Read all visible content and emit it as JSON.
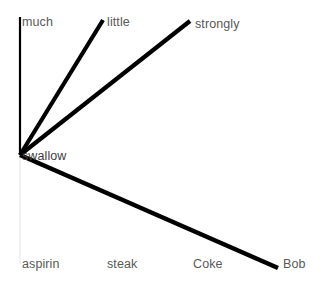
{
  "canvas": {
    "width": 325,
    "height": 292,
    "background": "#ffffff"
  },
  "colors": {
    "edge": "#000000",
    "edge_faint": "#ededed",
    "label_text": "#595959",
    "node_text": "#3d3d3d"
  },
  "center_node": {
    "label": "swallow",
    "x": 20,
    "y": 155,
    "label_x": 22,
    "label_y": 150
  },
  "edges": [
    {
      "id": "edge-much",
      "label": "much",
      "x1": 20,
      "y1": 155,
      "x2": 20,
      "y2": 17,
      "width": 2.2
    },
    {
      "id": "edge-little",
      "label": "little",
      "x1": 20,
      "y1": 155,
      "x2": 103,
      "y2": 20,
      "width": 4.2
    },
    {
      "id": "edge-strongly",
      "label": "strongly",
      "x1": 20,
      "y1": 155,
      "x2": 190,
      "y2": 21,
      "width": 4.2
    },
    {
      "id": "edge-bob",
      "label": "Bob",
      "x1": 20,
      "y1": 155,
      "x2": 278,
      "y2": 268,
      "width": 4.6
    },
    {
      "id": "edge-aspirin",
      "label": "aspirin",
      "x1": 20,
      "y1": 158,
      "x2": 20,
      "y2": 264,
      "width": 1.6
    }
  ],
  "labels": [
    {
      "id": "label-much",
      "text": "much",
      "x": 22,
      "y": 16
    },
    {
      "id": "label-little",
      "text": "little",
      "x": 107,
      "y": 16
    },
    {
      "id": "label-strongly",
      "text": "strongly",
      "x": 195,
      "y": 18
    },
    {
      "id": "label-swallow",
      "text": "swallow",
      "x": 22,
      "y": 150
    },
    {
      "id": "label-aspirin",
      "text": "aspirin",
      "x": 22,
      "y": 258
    },
    {
      "id": "label-steak",
      "text": "steak",
      "x": 107,
      "y": 258
    },
    {
      "id": "label-coke",
      "text": "Coke",
      "x": 193,
      "y": 258
    },
    {
      "id": "label-bob",
      "text": "Bob",
      "x": 283,
      "y": 258
    }
  ],
  "chart_data": {
    "type": "scatter",
    "title": "",
    "xlabel": "",
    "ylabel": "",
    "center": {
      "label": "swallow",
      "x": 20,
      "y": 155
    },
    "points": [
      {
        "label": "much",
        "x": 20,
        "y": 17,
        "stroke_width": 2.2,
        "rendered": true
      },
      {
        "label": "little",
        "x": 103,
        "y": 20,
        "stroke_width": 4.2,
        "rendered": true
      },
      {
        "label": "strongly",
        "x": 190,
        "y": 21,
        "stroke_width": 4.2,
        "rendered": true
      },
      {
        "label": "aspirin",
        "x": 20,
        "y": 264,
        "stroke_width": 1.6,
        "rendered": false
      },
      {
        "label": "steak",
        "x": 107,
        "y": 264,
        "stroke_width": 0,
        "rendered": false
      },
      {
        "label": "Coke",
        "x": 193,
        "y": 264,
        "stroke_width": 0,
        "rendered": false
      },
      {
        "label": "Bob",
        "x": 278,
        "y": 268,
        "stroke_width": 4.6,
        "rendered": true
      }
    ],
    "categories": [
      "much",
      "little",
      "strongly",
      "aspirin",
      "steak",
      "Coke",
      "Bob"
    ],
    "grid": false,
    "legend": "none"
  }
}
